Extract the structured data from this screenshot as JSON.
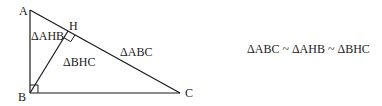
{
  "diagram": {
    "vertices": {
      "A": {
        "label": "A",
        "x": 30,
        "y": 10
      },
      "B": {
        "label": "B",
        "x": 30,
        "y": 93
      },
      "C": {
        "label": "C",
        "x": 180,
        "y": 93
      },
      "H": {
        "label": "H",
        "x": 68,
        "y": 31
      }
    },
    "regions": {
      "ahb": "ΔAHB",
      "bhc": "ΔBHC",
      "abc": "ΔABC"
    },
    "relation": "ΔABC ~ ΔAHB ~ ΔBHC",
    "colors": {
      "line": "#1a1a1a",
      "background": "#ffffff"
    }
  }
}
